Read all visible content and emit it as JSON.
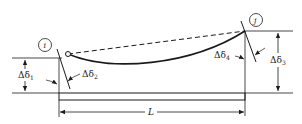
{
  "diagram": {
    "type": "beam-deflection",
    "nodes": {
      "left": {
        "label": "i"
      },
      "right": {
        "label": "j"
      }
    },
    "labels": {
      "delta1": {
        "main": "Δδ",
        "sub": "1"
      },
      "delta2": {
        "main": "Δδ",
        "sub": "2"
      },
      "delta3": {
        "main": "Δδ",
        "sub": "3"
      },
      "delta4": {
        "main": "Δδ",
        "sub": "4"
      },
      "length": "L"
    },
    "colors": {
      "ink": "#1a1a1a",
      "background": "#ffffff"
    }
  }
}
